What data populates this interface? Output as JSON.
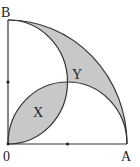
{
  "diagram": {
    "points": {
      "O": {
        "label": "0",
        "x": 8,
        "y": 144
      },
      "A": {
        "label": "A",
        "x": 127,
        "y": 144
      },
      "B": {
        "label": "B",
        "x": 8,
        "y": 20
      }
    },
    "regions": {
      "X": {
        "label": "X"
      },
      "Y": {
        "label": "Y"
      }
    },
    "colors": {
      "shade": "#c8c8c8",
      "stroke": "#333333",
      "background": "#ffffff"
    }
  }
}
